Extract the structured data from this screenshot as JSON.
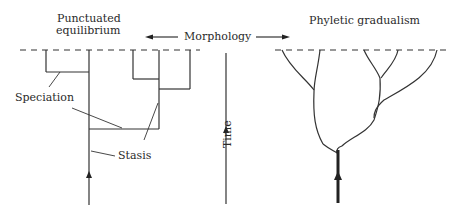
{
  "diagram": {
    "left_panel": {
      "title_line1": "Punctuated",
      "title_line2": "equilibrium",
      "labels": {
        "speciation": "Speciation",
        "stasis": "Stasis"
      }
    },
    "center": {
      "morphology_label": "Morphology",
      "time_label": "Time"
    },
    "right_panel": {
      "title": "Phyletic gradualism"
    },
    "colors": {
      "ink": "#222222",
      "background": "#ffffff"
    }
  }
}
